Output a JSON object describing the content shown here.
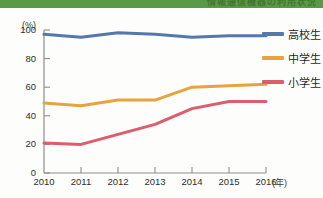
{
  "banner": {
    "text": "情報通信機器の利用状況"
  },
  "chart_data": {
    "type": "line",
    "title": "",
    "xlabel": "(年)",
    "ylabel": "(%)",
    "categories": [
      "2010",
      "2011",
      "2012",
      "2013",
      "2014",
      "2015",
      "2016"
    ],
    "x": [
      2010,
      2011,
      2012,
      2013,
      2014,
      2015,
      2016
    ],
    "xlim": [
      2010,
      2016
    ],
    "ylim": [
      0,
      100
    ],
    "yticks": [
      "0",
      "20",
      "40",
      "60",
      "80",
      "100"
    ],
    "ytick_values": [
      0,
      20,
      40,
      60,
      80,
      100
    ],
    "grid": false,
    "legend_position": "right",
    "series": [
      {
        "name": "高校生",
        "color": "#5578ac",
        "values": [
          97,
          95,
          98,
          97,
          95,
          96,
          96
        ]
      },
      {
        "name": "中学生",
        "color": "#e8a33d",
        "values": [
          49,
          47,
          51,
          51,
          60,
          61,
          62
        ]
      },
      {
        "name": "小学生",
        "color": "#dd5c6e",
        "values": [
          21,
          20,
          27,
          34,
          45,
          50,
          50
        ]
      }
    ]
  },
  "axes": {
    "y_unit": "(%)",
    "x_unit": "(年)"
  }
}
